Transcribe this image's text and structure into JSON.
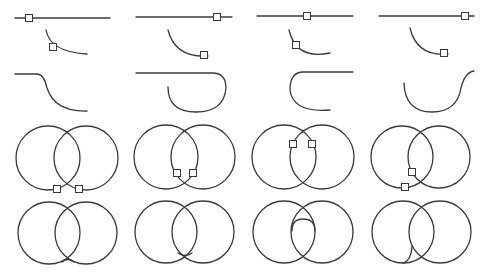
{
  "diagram": {
    "title": "",
    "colors": {
      "stroke": "#3a3a3a",
      "background": "#ffffff",
      "grip_fill": "#ffffff"
    },
    "rows": [
      {
        "name": "line-and-arc-picks",
        "cells": [
          {
            "line": [
              15,
              18,
              110,
              18
            ],
            "arc": "M46 30 Q50 52 87 54",
            "grips": [
              [
                29,
                18
              ],
              [
                53,
                47
              ]
            ]
          },
          {
            "line": [
              136,
              17,
              232,
              17
            ],
            "arc": "M168 30 Q175 58 208 56",
            "grips": [
              [
                217,
                17
              ],
              [
                204,
                55
              ]
            ]
          },
          {
            "line": [
              257,
              16,
              353,
              16
            ],
            "arc": "M289 30 Q296 60 330 53",
            "grips": [
              [
                307,
                16
              ],
              [
                296,
                45
              ]
            ]
          },
          {
            "line": [
              379,
              16,
              474,
              16
            ],
            "arc": "M410 28 Q417 57 448 54",
            "grips": [
              [
                465,
                16
              ],
              [
                444,
                53
              ]
            ]
          }
        ]
      },
      {
        "name": "line-arc-blend-results",
        "cells": [
          {
            "path": "M15 74 L37 74 Q44 74 47 88 Q55 112 87 111"
          },
          {
            "path": "M136 73 L214 73 Q226 74 226 88 Q224 112 196 112 Q168 112 168 87"
          },
          {
            "path": "M353 72 L302 72 Q290 73 290 90 Q293 113 330 110"
          },
          {
            "path": "M404 83 Q405 112 432 112 Q457 112 461 88 Q465 72 474 71"
          }
        ]
      },
      {
        "name": "circle-pairs-with-picks",
        "cells": [
          {
            "circles": [
              [
                48,
                158,
                32
              ],
              [
                86,
                158,
                32
              ]
            ],
            "grips": [
              [
                57,
                189
              ],
              [
                79,
                189
              ]
            ]
          },
          {
            "circles": [
              [
                166,
                157,
                32
              ],
              [
                203,
                157,
                32
              ]
            ],
            "grips": [
              [
                177,
                173
              ],
              [
                193,
                173
              ]
            ]
          },
          {
            "circles": [
              [
                284,
                157,
                32
              ],
              [
                322,
                157,
                32
              ]
            ],
            "grips": [
              [
                293,
                144
              ],
              [
                312,
                144
              ]
            ]
          },
          {
            "circles": [
              [
                402,
                157,
                31
              ],
              [
                439,
                157,
                31
              ]
            ],
            "grips": [
              [
                412,
                172
              ],
              [
                405,
                187
              ]
            ]
          }
        ]
      },
      {
        "name": "circle-pairs-with-fillets",
        "cells": [
          {
            "circles": [
              [
                49,
                233,
                31
              ],
              [
                86,
                233,
                31
              ]
            ],
            "fillet": "M62 262 Q68 257 74 262"
          },
          {
            "circles": [
              [
                166,
                232,
                31
              ],
              [
                203,
                232,
                31
              ]
            ],
            "fillet": "M178 253 Q185 258 192 253"
          },
          {
            "circles": [
              [
                284,
                232,
                31
              ],
              [
                322,
                232,
                31
              ]
            ],
            "fillet": "M292 231 Q292 219 303 219 Q315 219 315 231"
          },
          {
            "circles": [
              [
                403,
                232,
                31
              ],
              [
                440,
                232,
                31
              ]
            ],
            "fillet": "M403 263 Q411 261 412 246"
          }
        ]
      }
    ]
  }
}
